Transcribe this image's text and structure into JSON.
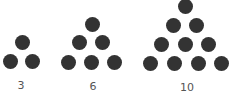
{
  "dot_color": "#333333",
  "dot_diameter": 15,
  "groups": [
    {
      "label": "3",
      "label_pos": [
        21,
        80
      ],
      "dots": [
        [
          22,
          42
        ],
        [
          10,
          61
        ],
        [
          32,
          61
        ]
      ]
    },
    {
      "label": "6",
      "label_pos": [
        93,
        81
      ],
      "dots": [
        [
          92,
          24
        ],
        [
          79,
          42
        ],
        [
          102,
          42
        ],
        [
          68,
          62
        ],
        [
          91,
          62
        ],
        [
          114,
          62
        ]
      ]
    },
    {
      "label": "10",
      "label_pos": [
        187,
        82
      ],
      "dots": [
        [
          185,
          6
        ],
        [
          173,
          25
        ],
        [
          196,
          25
        ],
        [
          161,
          44
        ],
        [
          185,
          44
        ],
        [
          208,
          44
        ],
        [
          150,
          63
        ],
        [
          174,
          63
        ],
        [
          198,
          63
        ],
        [
          221,
          63
        ]
      ]
    }
  ]
}
